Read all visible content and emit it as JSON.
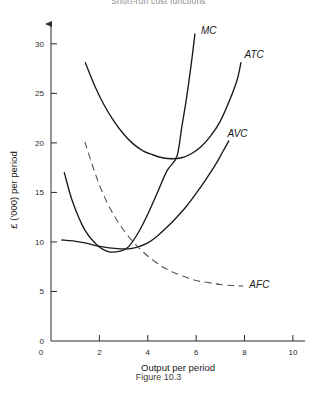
{
  "figure": {
    "title": "Short-run cost functions",
    "caption": "Figure 10.3"
  },
  "chart_data": {
    "type": "line",
    "title": "Short-run cost functions",
    "xlabel": "Output per period",
    "ylabel": "£ ('000) per period",
    "xlim": [
      0,
      10.5
    ],
    "ylim": [
      0,
      32
    ],
    "xticks": [
      0,
      2,
      4,
      6,
      8,
      10
    ],
    "yticks": [
      0,
      5,
      10,
      15,
      20,
      25,
      30
    ],
    "xtick_labels": [
      "0",
      "2",
      "4",
      "6",
      "8",
      "10"
    ],
    "ytick_labels": [
      "0",
      "5",
      "10",
      "15",
      "20",
      "25",
      "30"
    ],
    "grid": false,
    "legend": "inline-curve-labels",
    "series": [
      {
        "name": "MC",
        "label": "MC",
        "style": "solid",
        "color": "#1a1a1a",
        "label_x": 6.2,
        "label_y": 31.0,
        "points": [
          [
            0.55,
            17.0
          ],
          [
            0.9,
            14.0
          ],
          [
            1.4,
            11.2
          ],
          [
            1.9,
            9.7
          ],
          [
            2.4,
            9.0
          ],
          [
            2.9,
            9.1
          ],
          [
            3.2,
            9.5
          ],
          [
            3.6,
            10.9
          ],
          [
            4.0,
            12.8
          ],
          [
            4.4,
            15.0
          ],
          [
            4.8,
            17.2
          ],
          [
            5.2,
            18.6
          ],
          [
            5.4,
            21.5
          ],
          [
            5.6,
            24.5
          ],
          [
            5.8,
            28.0
          ],
          [
            5.95,
            31.0
          ]
        ]
      },
      {
        "name": "ATC",
        "label": "ATC",
        "style": "solid",
        "color": "#1a1a1a",
        "label_x": 8.0,
        "label_y": 28.6,
        "points": [
          [
            1.42,
            28.1
          ],
          [
            1.8,
            25.8
          ],
          [
            2.2,
            23.8
          ],
          [
            2.6,
            22.2
          ],
          [
            3.0,
            20.9
          ],
          [
            3.4,
            19.9
          ],
          [
            3.8,
            19.2
          ],
          [
            4.2,
            18.8
          ],
          [
            4.6,
            18.5
          ],
          [
            5.0,
            18.4
          ],
          [
            5.4,
            18.5
          ],
          [
            5.8,
            18.9
          ],
          [
            6.2,
            19.6
          ],
          [
            6.6,
            20.7
          ],
          [
            7.0,
            22.2
          ],
          [
            7.4,
            24.4
          ],
          [
            7.7,
            26.4
          ],
          [
            7.85,
            28.1
          ]
        ]
      },
      {
        "name": "AVC",
        "label": "AVC",
        "style": "solid",
        "color": "#1a1a1a",
        "label_x": 7.3,
        "label_y": 20.6,
        "points": [
          [
            0.45,
            10.2
          ],
          [
            0.9,
            10.1
          ],
          [
            1.4,
            9.9
          ],
          [
            1.9,
            9.6
          ],
          [
            2.4,
            9.4
          ],
          [
            2.9,
            9.3
          ],
          [
            3.2,
            9.3
          ],
          [
            3.6,
            9.5
          ],
          [
            4.0,
            9.9
          ],
          [
            4.4,
            10.6
          ],
          [
            4.8,
            11.5
          ],
          [
            5.2,
            12.5
          ],
          [
            5.6,
            13.6
          ],
          [
            6.0,
            14.9
          ],
          [
            6.4,
            16.3
          ],
          [
            6.8,
            17.8
          ],
          [
            7.1,
            19.1
          ],
          [
            7.35,
            20.2
          ]
        ]
      },
      {
        "name": "AFC",
        "label": "AFC",
        "style": "dashed",
        "color": "#555555",
        "label_x": 8.2,
        "label_y": 5.4,
        "points": [
          [
            1.4,
            20.1
          ],
          [
            1.8,
            17.1
          ],
          [
            2.2,
            14.6
          ],
          [
            2.6,
            12.7
          ],
          [
            3.0,
            11.2
          ],
          [
            3.4,
            10.0
          ],
          [
            3.8,
            9.0
          ],
          [
            4.2,
            8.2
          ],
          [
            4.6,
            7.5
          ],
          [
            5.0,
            7.0
          ],
          [
            5.5,
            6.5
          ],
          [
            6.0,
            6.1
          ],
          [
            6.5,
            5.9
          ],
          [
            7.0,
            5.7
          ],
          [
            7.5,
            5.6
          ],
          [
            7.95,
            5.55
          ]
        ]
      }
    ]
  }
}
